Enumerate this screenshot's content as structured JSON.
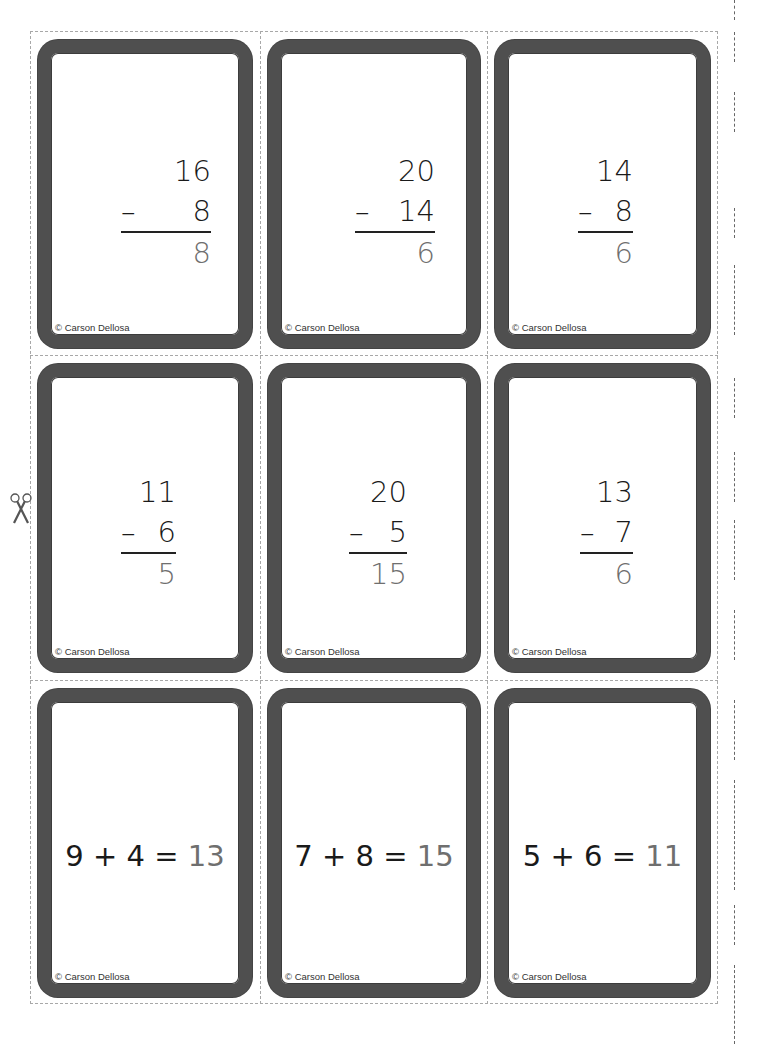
{
  "sheet": {
    "copyright": "© Carson Dellosa",
    "cut_icon": "scissors-icon"
  },
  "cards": [
    {
      "type": "subtraction",
      "top": "16",
      "op": "–",
      "bottom": "8",
      "answer": "8"
    },
    {
      "type": "subtraction",
      "top": "20",
      "op": "–",
      "bottom": "14",
      "answer": "6"
    },
    {
      "type": "subtraction",
      "top": "14",
      "op": "–",
      "bottom": "8",
      "answer": "6"
    },
    {
      "type": "subtraction",
      "top": "11",
      "op": "–",
      "bottom": "6",
      "answer": "5"
    },
    {
      "type": "subtraction",
      "top": "20",
      "op": "–",
      "bottom": "5",
      "answer": "15"
    },
    {
      "type": "subtraction",
      "top": "13",
      "op": "–",
      "bottom": "7",
      "answer": "6"
    },
    {
      "type": "addition",
      "expr": "9 + 4 =",
      "answer": "13"
    },
    {
      "type": "addition",
      "expr": "7 + 8 =",
      "answer": "15"
    },
    {
      "type": "addition",
      "expr": "5 + 6 =",
      "answer": "11"
    }
  ],
  "colors": {
    "border": "#4f4f4f",
    "answer": "#6f6f6f",
    "text": "#1a1a1a",
    "cut_line": "#a8a8a8"
  }
}
